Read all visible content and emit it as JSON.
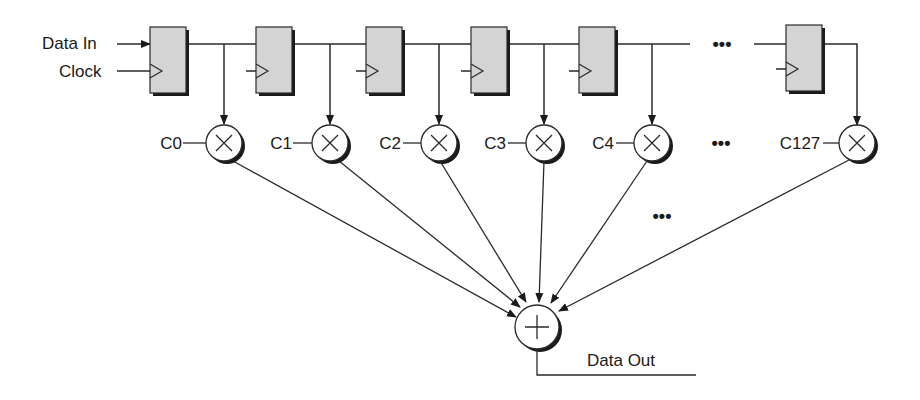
{
  "inputs": {
    "data_in": "Data In",
    "clock": "Clock"
  },
  "output": {
    "data_out": "Data Out"
  },
  "registers": [
    {
      "id": "reg-0",
      "x": 150
    },
    {
      "id": "reg-1",
      "x": 256
    },
    {
      "id": "reg-2",
      "x": 366
    },
    {
      "id": "reg-3",
      "x": 471
    },
    {
      "id": "reg-4",
      "x": 579
    },
    {
      "id": "reg-127",
      "x": 786
    }
  ],
  "multipliers": [
    {
      "coef": "C0",
      "cx": 224
    },
    {
      "coef": "C1",
      "cx": 330
    },
    {
      "coef": "C2",
      "cx": 437
    },
    {
      "coef": "C3",
      "cx": 543
    },
    {
      "coef": "C4",
      "cx": 651
    },
    {
      "coef": "C127",
      "cx": 857
    }
  ],
  "ellipsis": "•••",
  "colors": {
    "register_fill": "#d4d4d4",
    "shadow": "#1a1a1a",
    "line": "#2a2a2a"
  }
}
